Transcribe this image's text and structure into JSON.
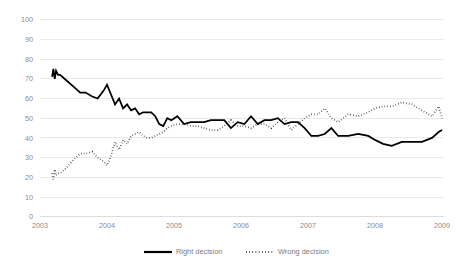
{
  "chart_data": {
    "type": "line",
    "title": "",
    "subtitle": "",
    "xlabel": "",
    "ylabel": "",
    "xlim": [
      2003.0,
      2009.05
    ],
    "ylim": [
      0,
      100
    ],
    "grid": true,
    "legend_position": "bottom",
    "x_tick_labels": [
      "2003",
      "2004",
      "2005",
      "2006",
      "2007",
      "2008",
      "2009"
    ],
    "x_tick_values": [
      2003,
      2004,
      2005,
      2006,
      2007,
      2008,
      2009
    ],
    "y_tick_labels": [
      "0",
      "10",
      "20",
      "30",
      "40",
      "50",
      "60",
      "70",
      "80",
      "90",
      "100"
    ],
    "y_tick_values": [
      0,
      10,
      20,
      30,
      40,
      50,
      60,
      70,
      80,
      90,
      100
    ],
    "series": [
      {
        "name": "Right decision",
        "style": "solid",
        "color": "#000000",
        "x": [
          2003.18,
          2003.2,
          2003.22,
          2003.24,
          2003.27,
          2003.3,
          2003.4,
          2003.5,
          2003.6,
          2003.68,
          2003.78,
          2003.86,
          2003.95,
          2004.0,
          2004.06,
          2004.12,
          2004.18,
          2004.24,
          2004.3,
          2004.36,
          2004.42,
          2004.48,
          2004.54,
          2004.6,
          2004.66,
          2004.72,
          2004.78,
          2004.84,
          2004.9,
          2004.96,
          2005.05,
          2005.15,
          2005.25,
          2005.35,
          2005.45,
          2005.55,
          2005.65,
          2005.75,
          2005.85,
          2005.95,
          2006.05,
          2006.15,
          2006.25,
          2006.35,
          2006.45,
          2006.55,
          2006.65,
          2006.75,
          2006.85,
          2006.95,
          2007.05,
          2007.15,
          2007.25,
          2007.35,
          2007.45,
          2007.6,
          2007.75,
          2007.9,
          2008.0,
          2008.12,
          2008.25,
          2008.4,
          2008.55,
          2008.7,
          2008.85,
          2008.95,
          2009.0
        ],
        "y": [
          71,
          75,
          70,
          74,
          72,
          72,
          69,
          66,
          63,
          63,
          61,
          60,
          64,
          67,
          62,
          57,
          60,
          55,
          57,
          54,
          55,
          52,
          53,
          53,
          53,
          51,
          47,
          46,
          50,
          49,
          51,
          47,
          48,
          48,
          48,
          49,
          49,
          49,
          45,
          48,
          47,
          51,
          47,
          49,
          49,
          50,
          47,
          48,
          48,
          45,
          41,
          41,
          42,
          45,
          41,
          41,
          42,
          41,
          39,
          37,
          36,
          38,
          38,
          38,
          40,
          43,
          44
        ],
        "y_start_value": 71,
        "y_end_value": 44,
        "y_max": 75,
        "y_min": 36
      },
      {
        "name": "Wrong decision",
        "style": "dotted",
        "color": "#000000",
        "x": [
          2003.18,
          2003.2,
          2003.22,
          2003.24,
          2003.27,
          2003.3,
          2003.4,
          2003.5,
          2003.6,
          2003.68,
          2003.78,
          2003.86,
          2003.95,
          2004.0,
          2004.06,
          2004.12,
          2004.18,
          2004.24,
          2004.3,
          2004.36,
          2004.42,
          2004.48,
          2004.54,
          2004.6,
          2004.66,
          2004.72,
          2004.78,
          2004.84,
          2004.9,
          2004.96,
          2005.05,
          2005.15,
          2005.25,
          2005.35,
          2005.45,
          2005.55,
          2005.65,
          2005.75,
          2005.85,
          2005.95,
          2006.05,
          2006.15,
          2006.25,
          2006.35,
          2006.45,
          2006.55,
          2006.65,
          2006.75,
          2006.85,
          2006.95,
          2007.05,
          2007.15,
          2007.25,
          2007.35,
          2007.45,
          2007.6,
          2007.75,
          2007.9,
          2008.0,
          2008.12,
          2008.25,
          2008.4,
          2008.55,
          2008.7,
          2008.85,
          2008.95,
          2009.0
        ],
        "y": [
          22,
          19,
          24,
          21,
          22,
          22,
          25,
          29,
          32,
          32,
          33,
          30,
          28,
          26,
          31,
          38,
          34,
          39,
          37,
          41,
          42,
          43,
          41,
          40,
          40,
          41,
          42,
          43,
          45,
          46,
          47,
          47,
          46,
          46,
          45,
          44,
          44,
          46,
          49,
          46,
          46,
          45,
          47,
          47,
          45,
          48,
          50,
          44,
          47,
          50,
          52,
          52,
          55,
          50,
          48,
          52,
          51,
          53,
          55,
          56,
          56,
          58,
          57,
          54,
          51,
          56,
          50
        ],
        "y_start_value": 22,
        "y_end_value": 50,
        "y_max": 58,
        "y_min": 19
      }
    ],
    "legend_entries": [
      "Right decision",
      "Wrong decision"
    ]
  },
  "legend": {
    "right_decision": "Right decision",
    "wrong_decision": "Wrong decision"
  },
  "axes": {
    "y_min_label": "0",
    "y_max_label": "100"
  }
}
